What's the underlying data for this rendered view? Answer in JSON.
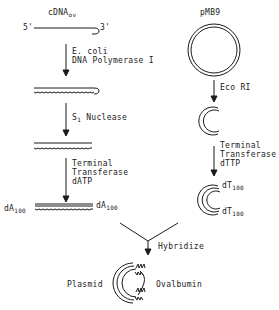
{
  "left_column": {
    "cdna_label": "cDNA",
    "cdna_sub": "ov",
    "five_prime": "5'",
    "three_prime": "3'",
    "step1_line1": "E. coli",
    "step1_line2": "DNA Polymerase I",
    "step2_label": "S",
    "step2_sub": "1",
    "step2_rest": " Nuclease",
    "step3_line1": "Terminal",
    "step3_line2": "Transferase",
    "step3_line3": "dATP",
    "tail_left": "dA",
    "tail_left_sub": "100",
    "tail_right": "dA",
    "tail_right_sub": "100"
  },
  "right_column": {
    "plasmid_label": "pMB9",
    "step1_label": "Eco RI",
    "step2_line1": "Terminal",
    "step2_line2": "Transferase",
    "step2_line3": "dTTP",
    "tail_top": "dT",
    "tail_top_sub": "100",
    "tail_bottom": "dT",
    "tail_bottom_sub": "100"
  },
  "merge": {
    "hybridize_label": "Hybridize",
    "plasmid_label": "Plasmid",
    "ovalbumin_label": "Ovalbumin"
  },
  "colors": {
    "ink": "#1a1a1a",
    "background": "#ffffff"
  }
}
